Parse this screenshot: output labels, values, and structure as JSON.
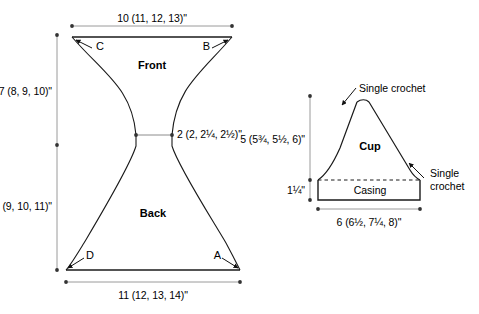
{
  "figure": {
    "type": "garment-schematic",
    "background_color": "#ffffff",
    "outline_color": "#1a1a1a",
    "dimension_line_color": "#9a9a9a",
    "text_color": "#000000"
  },
  "pieces": [
    {
      "id": "front-back-panel",
      "shape": "hourglass",
      "sections": [
        {
          "name": "Front",
          "label": "Front"
        },
        {
          "name": "Back",
          "label": "Back"
        }
      ],
      "corner_markers": [
        {
          "id": "C",
          "label": "C",
          "position": "top-left"
        },
        {
          "id": "B",
          "label": "B",
          "position": "top-right"
        },
        {
          "id": "D",
          "label": "D",
          "position": "bottom-left"
        },
        {
          "id": "A",
          "label": "A",
          "position": "bottom-right"
        }
      ],
      "dimensions": [
        {
          "id": "top-width",
          "label": "10 (11, 12, 13)\"",
          "orientation": "horizontal",
          "placement": "top"
        },
        {
          "id": "front-height",
          "label": "7 (8, 9, 10)\"",
          "orientation": "vertical",
          "placement": "left-upper"
        },
        {
          "id": "back-height",
          "label": "8 (9, 10, 11)\"",
          "orientation": "vertical",
          "placement": "left-lower"
        },
        {
          "id": "waist-width",
          "label": "2 (2, 2¼, 2½)\"",
          "orientation": "horizontal",
          "placement": "middle-right"
        },
        {
          "id": "bottom-width",
          "label": "11 (12, 13, 14)\"",
          "orientation": "horizontal",
          "placement": "bottom"
        }
      ]
    },
    {
      "id": "cup-panel",
      "shape": "triangle-with-casing",
      "sections": [
        {
          "name": "Cup",
          "label": "Cup"
        },
        {
          "name": "Casing",
          "label": "Casing"
        }
      ],
      "annotations": [
        {
          "id": "single-crochet-top",
          "label": "Single crochet",
          "points_to": "cup-left-edge"
        },
        {
          "id": "single-crochet-right",
          "line1": "Single",
          "line2": "crochet",
          "points_to": "cup-right-edge"
        }
      ],
      "dimensions": [
        {
          "id": "cup-height",
          "label": "5 (5¾, 5½, 6)\"",
          "orientation": "vertical",
          "placement": "left-upper"
        },
        {
          "id": "casing-height",
          "label": "1¼\"",
          "orientation": "vertical",
          "placement": "left-lower"
        },
        {
          "id": "cup-base-width",
          "label": "6 (6½, 7¼, 8)\"",
          "orientation": "horizontal",
          "placement": "bottom"
        }
      ]
    }
  ]
}
